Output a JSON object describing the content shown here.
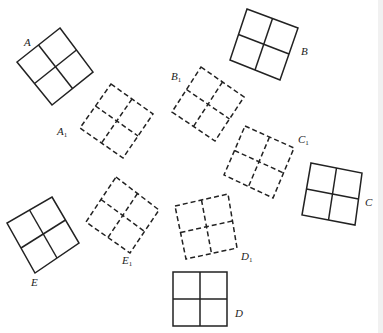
{
  "figure": {
    "stroke_color": "#222222",
    "solid_squares": [
      {
        "id": "A",
        "label": "A",
        "corners": [
          [
            60,
            28
          ],
          [
            93,
            72
          ],
          [
            52,
            105
          ],
          [
            17,
            62
          ]
        ],
        "label_pos": [
          24,
          37
        ]
      },
      {
        "id": "B",
        "label": "B",
        "corners": [
          [
            247,
            9
          ],
          [
            298,
            28
          ],
          [
            280,
            80
          ],
          [
            230,
            60
          ]
        ],
        "label_pos": [
          301,
          46
        ]
      },
      {
        "id": "C",
        "label": "C",
        "corners": [
          [
            311,
            163
          ],
          [
            362,
            173
          ],
          [
            355,
            225
          ],
          [
            302,
            215
          ]
        ],
        "label_pos": [
          365,
          197
        ]
      },
      {
        "id": "D",
        "label": "D",
        "corners": [
          [
            173,
            272
          ],
          [
            227,
            272
          ],
          [
            227,
            326
          ],
          [
            173,
            326
          ]
        ],
        "label_pos": [
          235,
          308
        ]
      },
      {
        "id": "E",
        "label": "E",
        "corners": [
          [
            52,
            197
          ],
          [
            79,
            243
          ],
          [
            35,
            273
          ],
          [
            7,
            223
          ]
        ],
        "label_pos": [
          31,
          277
        ]
      }
    ],
    "dashed_squares": [
      {
        "id": "A1",
        "label": "A",
        "subscript": "1",
        "corners": [
          [
            111,
            84
          ],
          [
            153,
            114
          ],
          [
            123,
            158
          ],
          [
            80,
            128
          ]
        ],
        "label_pos": [
          57,
          126
        ]
      },
      {
        "id": "B1",
        "label": "B",
        "subscript": "1",
        "corners": [
          [
            201,
            67
          ],
          [
            244,
            97
          ],
          [
            215,
            141
          ],
          [
            172,
            112
          ]
        ],
        "label_pos": [
          171,
          71
        ]
      },
      {
        "id": "C1",
        "label": "C",
        "subscript": "1",
        "corners": [
          [
            245,
            126
          ],
          [
            294,
            148
          ],
          [
            273,
            198
          ],
          [
            224,
            175
          ]
        ],
        "label_pos": [
          298,
          134
        ]
      },
      {
        "id": "D1",
        "label": "D",
        "subscript": "1",
        "corners": [
          [
            175,
            206
          ],
          [
            228,
            194
          ],
          [
            237,
            248
          ],
          [
            186,
            259
          ]
        ],
        "label_pos": [
          241,
          251
        ]
      },
      {
        "id": "E1",
        "label": "E",
        "subscript": "1",
        "corners": [
          [
            116,
            177
          ],
          [
            159,
            210
          ],
          [
            130,
            253
          ],
          [
            86,
            222
          ]
        ],
        "label_pos": [
          122,
          255
        ]
      }
    ]
  }
}
